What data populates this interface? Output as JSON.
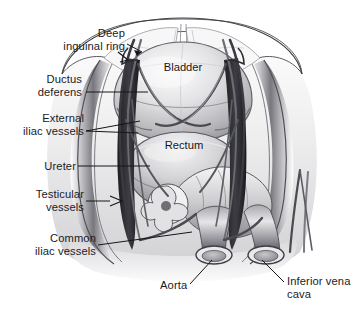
{
  "figure": {
    "width": 363,
    "height": 316,
    "background": "#ffffff",
    "style": "grayscale medical line-and-wash illustration"
  },
  "labels": {
    "deep_inguinal_ring": "Deep\ninguinal ring",
    "ductus_deferens": "Ductus\ndeferens",
    "external_iliac_vessels": "External\niliac vessels",
    "ureter": "Ureter",
    "testicular_vessels": "Testicular\nvessels",
    "common_iliac_vessels": "Common\niliac vessels",
    "aorta": "Aorta",
    "inferior_vena_cava": "Inferior vena\ncava",
    "bladder": "Bladder",
    "rectum": "Rectum"
  },
  "colors": {
    "text": "#1b1b1f",
    "leader_line": "#16161a",
    "outline": "#3a3a40",
    "tissue_light": "#f2f2f2",
    "tissue_mid": "#c9c9cc",
    "tissue_dark": "#6e6e74",
    "vessel_dark": "#2e2e33",
    "vessel_mid": "#7a7a80",
    "background": "#ffffff"
  },
  "structures": [
    {
      "name": "abdominal-wall",
      "side": "superior"
    },
    {
      "name": "bladder",
      "side": "midline"
    },
    {
      "name": "rectum",
      "side": "midline"
    },
    {
      "name": "sigmoid-colon",
      "side": "midline"
    },
    {
      "name": "aorta-cut-end",
      "side": "left"
    },
    {
      "name": "inferior-vena-cava-cut-end",
      "side": "right"
    },
    {
      "name": "ureter",
      "side": "bilateral"
    },
    {
      "name": "ductus-deferens",
      "side": "bilateral"
    },
    {
      "name": "testicular-vessels",
      "side": "bilateral"
    },
    {
      "name": "external-iliac-vessels",
      "side": "bilateral"
    },
    {
      "name": "common-iliac-vessels",
      "side": "bilateral"
    },
    {
      "name": "deep-inguinal-ring",
      "side": "bilateral"
    }
  ]
}
